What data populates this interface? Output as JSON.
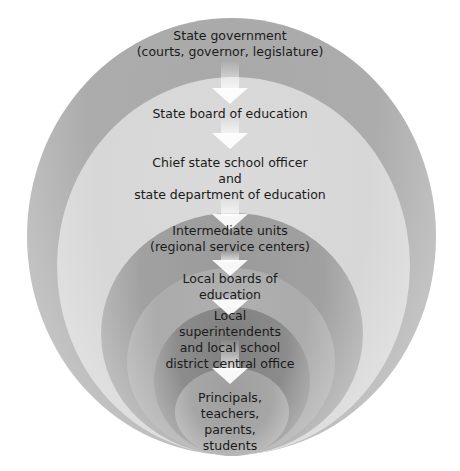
{
  "diagram": {
    "type": "nested-ellipses-hierarchy",
    "direction": "top-down arrows from outermost to innermost",
    "levels": [
      {
        "id": "state-government",
        "lines": [
          "State government",
          "(courts, governor, legislature)"
        ],
        "color": "#a9a9a9"
      },
      {
        "id": "state-board",
        "lines": [
          "State board of education"
        ],
        "color": "#d9d9d9"
      },
      {
        "id": "chief-state-school-officer",
        "lines": [
          "Chief state school officer",
          "and",
          "state department of education"
        ],
        "color": "#d9d9d9"
      },
      {
        "id": "intermediate-units",
        "lines": [
          "Intermediate units",
          "(regional service centers)"
        ],
        "color": "#9d9d9d"
      },
      {
        "id": "local-boards",
        "lines": [
          "Local boards of",
          "education"
        ],
        "color": "#adadad"
      },
      {
        "id": "local-superintendents",
        "lines": [
          "Local",
          "superintendents",
          "and local school",
          "district central office"
        ],
        "color": "#858585"
      },
      {
        "id": "principals",
        "lines": [
          "Principals,",
          "teachers,",
          "parents,",
          "students"
        ],
        "color": "#a2a2a2"
      }
    ],
    "arrow_color": "#ffffff"
  }
}
